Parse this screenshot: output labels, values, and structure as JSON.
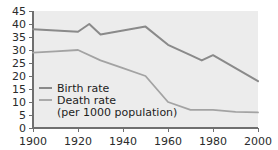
{
  "chart_data": {
    "type": "line",
    "title": "",
    "xlabel": "",
    "ylabel": "",
    "xlim": [
      1900,
      2000
    ],
    "ylim": [
      0,
      45
    ],
    "x_ticks": [
      1900,
      1920,
      1940,
      1960,
      1980,
      2000
    ],
    "y_ticks": [
      0,
      5,
      10,
      15,
      20,
      25,
      30,
      35,
      40,
      45
    ],
    "grid": false,
    "legend_position": "inside-lower-left",
    "units_note": "(per 1000 population)",
    "series": [
      {
        "name": "Birth rate",
        "color": "#8a8a8a",
        "x": [
          1900,
          1910,
          1920,
          1925,
          1930,
          1940,
          1950,
          1960,
          1970,
          1975,
          1980,
          1990,
          2000
        ],
        "values": [
          38,
          37.5,
          37,
          40,
          36,
          37.5,
          39,
          32,
          28,
          26,
          28,
          23,
          18
        ]
      },
      {
        "name": "Death rate",
        "color": "#a3a3a3",
        "x": [
          1900,
          1910,
          1920,
          1930,
          1940,
          1950,
          1960,
          1970,
          1980,
          1990,
          2000
        ],
        "values": [
          29,
          29.5,
          30,
          26,
          23,
          20,
          10,
          7,
          7,
          6.2,
          6
        ]
      }
    ]
  },
  "axes": {
    "y_tick_labels": [
      "45",
      "40",
      "35",
      "30",
      "25",
      "20",
      "15",
      "10",
      "5",
      "0"
    ],
    "x_tick_labels": [
      "1900",
      "1920",
      "1940",
      "1960",
      "1980",
      "2000"
    ]
  },
  "legend": {
    "entries": [
      {
        "label": "Birth rate"
      },
      {
        "label": "Death rate"
      }
    ],
    "note": "(per 1000 population)"
  },
  "colors": {
    "plot_background": "#ececec",
    "axis": "#6f6f6f",
    "birth_line": "#8a8a8a",
    "death_line": "#a3a3a3",
    "text": "#2b2b2b"
  }
}
